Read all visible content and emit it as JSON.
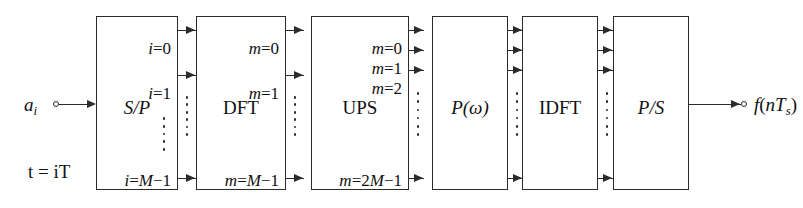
{
  "diagram": {
    "background_color": "#ffffff",
    "line_color": "#2b2b2b",
    "text_color": "#111111",
    "input": {
      "label_html": "a<span class=\"sub\">i</span>",
      "label_text": "a_i",
      "time_label_html": "t = iT",
      "time_label_text": "t = iT",
      "terminal": "open-circle"
    },
    "output": {
      "label_text": "f(nT_s)",
      "terminal": "open-circle"
    },
    "blocks": [
      {
        "id": "sp",
        "label": "S/P",
        "style": "italic",
        "ports": [
          "i=0",
          "i=1",
          "i=M−1"
        ]
      },
      {
        "id": "dft",
        "label": "DFT",
        "style": "upright",
        "ports": [
          "m=0",
          "m=1",
          "m=M−1"
        ]
      },
      {
        "id": "ups",
        "label": "UPS",
        "style": "upright",
        "ports": [
          "m=0",
          "m=1",
          "m=2",
          "m=2M−1"
        ]
      },
      {
        "id": "pw",
        "label": "P(ω)",
        "style": "italic",
        "ports": []
      },
      {
        "id": "idft",
        "label": "IDFT",
        "style": "upright",
        "ports": []
      },
      {
        "id": "ps",
        "label": "P/S",
        "style": "italic",
        "ports": []
      }
    ],
    "buses": [
      {
        "id": "bus-sp-dft",
        "arrow_count": 3,
        "has_ellipsis": true
      },
      {
        "id": "bus-dft-ups",
        "arrow_count": 3,
        "has_ellipsis": true
      },
      {
        "id": "bus-ups-pw",
        "arrow_count": 4,
        "has_ellipsis": true
      },
      {
        "id": "bus-pw-idft",
        "arrow_count": 4,
        "has_ellipsis": true
      },
      {
        "id": "bus-idft-ps",
        "arrow_count": 4,
        "has_ellipsis": true
      }
    ]
  }
}
